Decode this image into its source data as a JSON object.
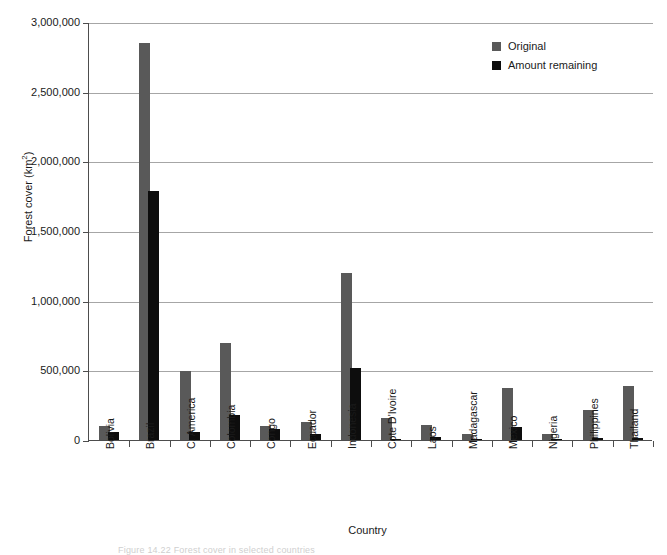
{
  "chart_data": {
    "type": "bar",
    "title": "",
    "xlabel": "Country",
    "ylabel": "Forest cover (km²)",
    "ylim": [
      0,
      3000000
    ],
    "yticks": [
      0,
      500000,
      1000000,
      1500000,
      2000000,
      2500000,
      3000000
    ],
    "ytick_labels": [
      "0",
      "500,000",
      "1,000,000",
      "1,500,000",
      "2,000,000",
      "2,500,000",
      "3,000,000"
    ],
    "grid": true,
    "legend_position": "top-right",
    "categories": [
      "Bolivia",
      "Brazil",
      "C. America",
      "Colombia",
      "Congo",
      "Ecuador",
      "Indonesia",
      "Cote D'Ivoire",
      "Laos",
      "Madagascar",
      "Mexico",
      "Nigeria",
      "Philippines",
      "Thailand"
    ],
    "series": [
      {
        "name": "Original",
        "color": "#595959",
        "values": [
          100000,
          2850000,
          495000,
          695000,
          100000,
          132000,
          1200000,
          155000,
          110000,
          45000,
          370000,
          45000,
          215000,
          390000
        ]
      },
      {
        "name": "Amount remaining",
        "color": "#0d0d0d",
        "values": [
          55000,
          1790000,
          60000,
          180000,
          80000,
          45000,
          515000,
          8000,
          25000,
          10000,
          95000,
          5000,
          12000,
          18000
        ]
      }
    ]
  },
  "axis": {
    "y_title_main": "Forest cover (km",
    "y_title_sup": "2",
    "y_title_tail": ")",
    "x_title": "Country"
  },
  "legend": {
    "items": [
      {
        "label": "Original",
        "swatch": "legend-swatch-original"
      },
      {
        "label": "Amount remaining",
        "swatch": "legend-swatch-remaining"
      }
    ]
  },
  "caption": {
    "text": "Figure 14.22  Forest cover in selected countries"
  }
}
